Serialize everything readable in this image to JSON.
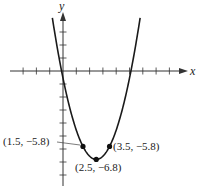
{
  "chart_data": {
    "type": "line",
    "title": "",
    "xlabel": "x",
    "ylabel": "y",
    "function": "y = (x - 2.5)^2 - 6.8",
    "grid": false,
    "xlim": [
      -3,
      9
    ],
    "ylim": [
      -8,
      4
    ],
    "x_tick_step": 1,
    "y_tick_step": 1,
    "tick_labels_shown": false,
    "series": [
      {
        "name": "parabola",
        "x": [
          -0.75,
          0,
          0.5,
          1,
          1.5,
          2,
          2.5,
          3,
          3.5,
          4,
          4.5,
          5,
          5.75
        ],
        "y": [
          3.76,
          -0.55,
          -2.8,
          -4.55,
          -5.8,
          -6.55,
          -6.8,
          -6.55,
          -5.8,
          -4.55,
          -2.8,
          -0.55,
          3.76
        ]
      }
    ],
    "points": [
      {
        "x": 1.5,
        "y": -5.8,
        "label": "(1.5, −5.8)"
      },
      {
        "x": 2.5,
        "y": -6.8,
        "label": "(2.5, −6.8)"
      },
      {
        "x": 3.5,
        "y": -5.8,
        "label": "(3.5, −5.8)"
      }
    ],
    "annotations": [
      "(1.5, −5.8)",
      "(2.5, −6.8)",
      "(3.5, −5.8)"
    ]
  },
  "axes": {
    "x_label": "x",
    "y_label": "y"
  },
  "labels": {
    "left_point": "(1.5, −5.8)",
    "vertex": "(2.5, −6.8)",
    "right_point": "(3.5, −5.8)"
  },
  "colors": {
    "curve": "#1a1a1a",
    "axis": "#333333",
    "text": "#222222"
  }
}
